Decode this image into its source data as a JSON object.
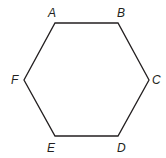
{
  "diagram": {
    "shape": "hexagon",
    "stroke_color": "#231f20",
    "vertices": [
      {
        "label": "A",
        "x": 55,
        "y": 23,
        "lx": 52,
        "ly": 17
      },
      {
        "label": "B",
        "x": 118,
        "y": 23,
        "lx": 121,
        "ly": 17
      },
      {
        "label": "C",
        "x": 149,
        "y": 80,
        "lx": 155,
        "ly": 84
      },
      {
        "label": "D",
        "x": 118,
        "y": 136,
        "lx": 121,
        "ly": 151
      },
      {
        "label": "E",
        "x": 55,
        "y": 136,
        "lx": 51,
        "ly": 151
      },
      {
        "label": "F",
        "x": 24,
        "y": 80,
        "lx": 13,
        "ly": 84
      }
    ]
  }
}
